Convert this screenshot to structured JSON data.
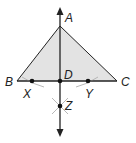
{
  "diagram": {
    "type": "geometry-construction",
    "fill_color": "#e3e3e3",
    "line_color": "#222222",
    "arc_color": "#b0b0b0",
    "points": {
      "A": {
        "label": "A",
        "x": 60,
        "y": 26
      },
      "B": {
        "label": "B",
        "x": 17,
        "y": 81
      },
      "C": {
        "label": "C",
        "x": 117,
        "y": 81
      },
      "D": {
        "label": "D",
        "x": 60,
        "y": 81
      },
      "X": {
        "label": "X",
        "x": 32,
        "y": 81
      },
      "Y": {
        "label": "Y",
        "x": 88,
        "y": 81
      },
      "Z": {
        "label": "Z",
        "x": 60,
        "y": 106
      }
    },
    "labels": {
      "A": "A",
      "B": "B",
      "C": "C",
      "D": "D",
      "X": "X",
      "Y": "Y",
      "Z": "Z"
    }
  }
}
